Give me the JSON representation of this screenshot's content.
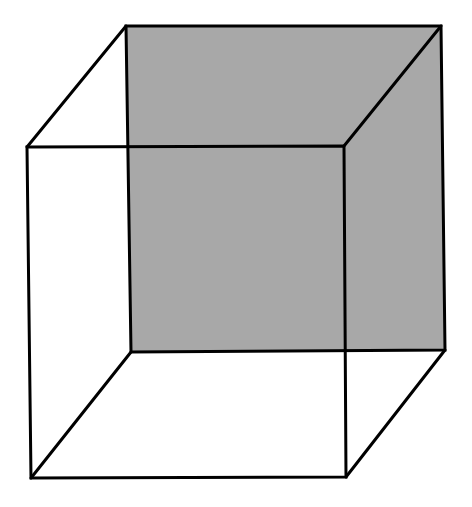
{
  "diagram": {
    "title": "",
    "type": "necker-cube",
    "colors": {
      "background": "#ffffff",
      "back_face_fill": "#a8a8a8",
      "stroke": "#000000"
    },
    "back_face": {
      "points": "126,26 441,26 445,350 131,352"
    },
    "front_face": {
      "points": "27,147 344,146 346,477 31,478"
    },
    "edges": [
      {
        "name": "edge-top-left",
        "x1": 27,
        "y1": 147,
        "x2": 126,
        "y2": 26
      },
      {
        "name": "edge-top-right",
        "x1": 344,
        "y1": 146,
        "x2": 441,
        "y2": 26
      },
      {
        "name": "edge-bottom-left",
        "x1": 31,
        "y1": 478,
        "x2": 131,
        "y2": 352
      },
      {
        "name": "edge-bottom-right",
        "x1": 346,
        "y1": 477,
        "x2": 445,
        "y2": 350
      }
    ]
  }
}
